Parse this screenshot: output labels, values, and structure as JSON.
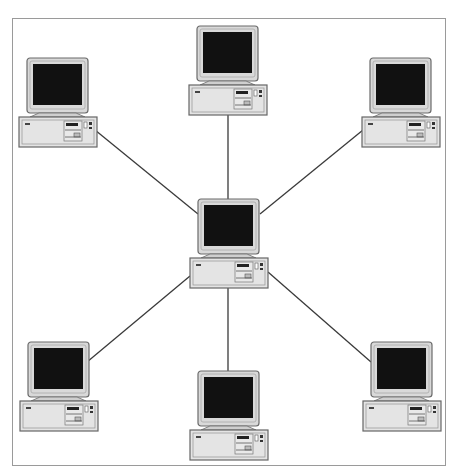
{
  "diagram": {
    "title": "Star network topology",
    "type": "star-topology",
    "colors": {
      "frame": "#9a9a9a",
      "line": "#3a3a3a",
      "monitor_bezel": "#d9d9d9",
      "monitor_outline": "#6b6b6b",
      "screen": "#111111",
      "case": "#e4e4e4",
      "case_outline": "#666666"
    },
    "hub": {
      "id": "center",
      "label": "Central computer (hub)",
      "x": 190,
      "y": 199
    },
    "nodes": [
      {
        "id": "top",
        "label": "Computer (top)",
        "x": 189,
        "y": 26
      },
      {
        "id": "top-left",
        "label": "Computer (top-left)",
        "x": 19,
        "y": 58
      },
      {
        "id": "top-right",
        "label": "Computer (top-right)",
        "x": 362,
        "y": 58
      },
      {
        "id": "bottom-left",
        "label": "Computer (bottom-left)",
        "x": 20,
        "y": 342
      },
      {
        "id": "bottom",
        "label": "Computer (bottom)",
        "x": 190,
        "y": 371
      },
      {
        "id": "bottom-right",
        "label": "Computer (bottom-right)",
        "x": 363,
        "y": 342
      }
    ],
    "links": [
      {
        "from": "center",
        "to": "top",
        "x1": 228,
        "y1": 199,
        "x2": 228,
        "y2": 113
      },
      {
        "from": "center",
        "to": "top-left",
        "x1": 198,
        "y1": 214,
        "x2": 95,
        "y2": 130
      },
      {
        "from": "center",
        "to": "top-right",
        "x1": 260,
        "y1": 214,
        "x2": 363,
        "y2": 130
      },
      {
        "from": "center",
        "to": "bottom-left",
        "x1": 190,
        "y1": 276,
        "x2": 87,
        "y2": 362
      },
      {
        "from": "center",
        "to": "bottom",
        "x1": 228,
        "y1": 285,
        "x2": 228,
        "y2": 371
      },
      {
        "from": "center",
        "to": "bottom-right",
        "x1": 268,
        "y1": 272,
        "x2": 371,
        "y2": 362
      }
    ]
  }
}
